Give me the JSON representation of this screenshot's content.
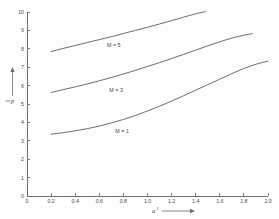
{
  "chart_data": {
    "type": "line",
    "title": "",
    "xlabel": "a2",
    "xlabel_base": "a",
    "xlabel_exponent": "2",
    "ylabel": "p",
    "xlim": [
      0,
      2.0
    ],
    "ylim": [
      0,
      10
    ],
    "grid": false,
    "legend_position": "inline-on-curve",
    "x_ticks": [
      0,
      0.2,
      0.4,
      0.6,
      0.8,
      1.0,
      1.2,
      1.4,
      1.6,
      1.8,
      2.0
    ],
    "x_tick_labels": [
      "0",
      "0.2",
      "0.4",
      "0.6",
      "0.8",
      "1.0",
      "1.2",
      "1.4",
      "1.6",
      "1.8",
      "2.0"
    ],
    "y_ticks": [
      0,
      1,
      2,
      3,
      4,
      5,
      6,
      7,
      8,
      9,
      10
    ],
    "y_tick_labels": [
      "0",
      "1",
      "2",
      "3",
      "4",
      "5",
      "6",
      "7",
      "8",
      "9",
      "10"
    ],
    "series": [
      {
        "name": "M = 5",
        "label": "M = 5",
        "label_x": 0.72,
        "label_y": 8.18,
        "x": [
          0.2,
          0.3,
          0.4,
          0.5,
          0.6,
          0.7,
          0.8,
          0.9,
          1.0,
          1.1,
          1.2,
          1.3,
          1.4,
          1.48
        ],
        "y": [
          7.85,
          8.02,
          8.18,
          8.34,
          8.5,
          8.66,
          8.83,
          9.0,
          9.17,
          9.35,
          9.53,
          9.72,
          9.9,
          10.02
        ]
      },
      {
        "name": "M = 3",
        "label": "M = 3",
        "label_x": 0.74,
        "label_y": 5.78,
        "x": [
          0.2,
          0.3,
          0.4,
          0.5,
          0.6,
          0.7,
          0.8,
          0.9,
          1.0,
          1.1,
          1.2,
          1.3,
          1.4,
          1.5,
          1.6,
          1.7,
          1.8,
          1.87
        ],
        "y": [
          5.62,
          5.78,
          5.93,
          6.09,
          6.26,
          6.44,
          6.63,
          6.83,
          7.04,
          7.25,
          7.47,
          7.7,
          7.93,
          8.16,
          8.38,
          8.58,
          8.74,
          8.82
        ]
      },
      {
        "name": "M = 1",
        "label": "M = 1",
        "label_x": 0.79,
        "label_y": 3.52,
        "x": [
          0.2,
          0.3,
          0.4,
          0.5,
          0.6,
          0.7,
          0.8,
          0.9,
          1.0,
          1.1,
          1.2,
          1.3,
          1.4,
          1.5,
          1.6,
          1.7,
          1.8,
          1.9,
          2.0
        ],
        "y": [
          3.36,
          3.44,
          3.54,
          3.66,
          3.8,
          3.97,
          4.16,
          4.38,
          4.62,
          4.88,
          5.16,
          5.45,
          5.75,
          6.05,
          6.35,
          6.65,
          6.93,
          7.16,
          7.33
        ]
      }
    ]
  },
  "colors": {
    "background": "#fdfdfd",
    "axis": "#6d6d6d",
    "curve": "#5d5d5d",
    "text": "#4a4a4a"
  }
}
